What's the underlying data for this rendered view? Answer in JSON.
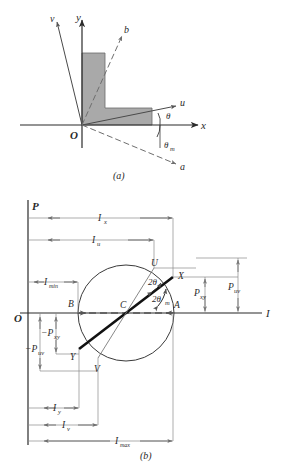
{
  "figure": {
    "caption_a": "(a)",
    "caption_b": "(b)"
  },
  "panel_a": {
    "axes": [
      {
        "name": "y-axis-label",
        "text": "y"
      },
      {
        "name": "x-axis-label",
        "text": "x"
      },
      {
        "name": "u-axis-label",
        "text": "u"
      },
      {
        "name": "v-axis-label",
        "text": "v"
      },
      {
        "name": "a-axis-label",
        "text": "a"
      },
      {
        "name": "b-axis-label",
        "text": "b"
      }
    ],
    "origin_label": "O",
    "angles": [
      {
        "name": "theta",
        "text": "θ"
      },
      {
        "name": "theta-m",
        "text": "θ",
        "sub": "m"
      }
    ],
    "section_fill": "#a9a9a9"
  },
  "panel_b": {
    "vertical_axis_label": "P",
    "horizontal_axis_label": "I",
    "origin_label": "O",
    "points": [
      {
        "name": "point-U",
        "text": "U"
      },
      {
        "name": "point-X",
        "text": "X"
      },
      {
        "name": "point-B",
        "text": "B"
      },
      {
        "name": "point-C",
        "text": "C"
      },
      {
        "name": "point-A",
        "text": "A"
      },
      {
        "name": "point-Y",
        "text": "Y"
      },
      {
        "name": "point-V",
        "text": "V"
      }
    ],
    "angles": [
      {
        "name": "two-theta",
        "base": "2θ",
        "sub": ""
      },
      {
        "name": "two-theta-m",
        "base": "2θ",
        "sub": "m"
      }
    ],
    "dimensions": [
      {
        "name": "dim-Ix",
        "base": "I",
        "sub": "x"
      },
      {
        "name": "dim-Iu",
        "base": "I",
        "sub": "u"
      },
      {
        "name": "dim-Imin",
        "base": "I",
        "sub": "min"
      },
      {
        "name": "dim-Iy",
        "base": "I",
        "sub": "y"
      },
      {
        "name": "dim-Iv",
        "base": "I",
        "sub": "v"
      },
      {
        "name": "dim-Imax",
        "base": "I",
        "sub": "max"
      },
      {
        "name": "dim-Pxy",
        "base": "P",
        "sub": "xy"
      },
      {
        "name": "dim-Puv",
        "base": "P",
        "sub": "uv"
      },
      {
        "name": "dim-neg-Pxy",
        "base": "−P",
        "sub": "xy"
      },
      {
        "name": "dim-neg-Puv",
        "base": "−P",
        "sub": "uv"
      }
    ]
  },
  "colors": {
    "line": "#2b2b2b",
    "thin": "#6e6e6e",
    "fill": "#a9a9a9",
    "background": "#ffffff"
  }
}
